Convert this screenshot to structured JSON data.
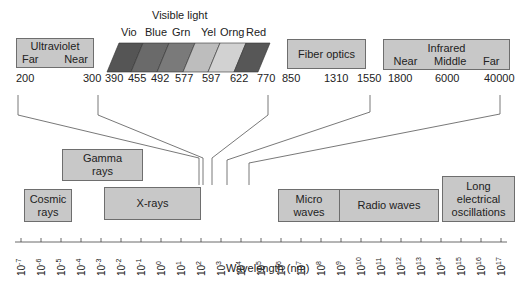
{
  "visible_light": {
    "title": "Visible light",
    "bands": [
      {
        "name": "Vio",
        "color": "#555555"
      },
      {
        "name": "Blue",
        "color": "#6a6a6a"
      },
      {
        "name": "Grn",
        "color": "#7a7a7a"
      },
      {
        "name": "Yel",
        "color": "#bdbdbd"
      },
      {
        "name": "Orng",
        "color": "#d0d0d0"
      },
      {
        "name": "Red",
        "color": "#575757"
      }
    ],
    "boundaries": [
      "390",
      "455",
      "492",
      "577",
      "597",
      "622",
      "770"
    ]
  },
  "ultraviolet": {
    "title": "Ultraviolet",
    "sub": [
      "Far",
      "Near"
    ],
    "range": [
      "200",
      "300"
    ]
  },
  "fiber_optics": {
    "title": "Fiber optics",
    "range": [
      "850",
      "1310",
      "1550"
    ]
  },
  "infrared": {
    "title": "Infrared",
    "sub": [
      "Near",
      "Middle",
      "Far"
    ],
    "range": [
      "1800",
      "6000",
      "40000"
    ]
  },
  "regions": {
    "gamma": "Gamma rays",
    "gamma_l1": "Gamma",
    "gamma_l2": "rays",
    "cosmic_l1": "Cosmic",
    "cosmic_l2": "rays",
    "xrays": "X-rays",
    "micro_l1": "Micro",
    "micro_l2": "waves",
    "radio": "Radio waves",
    "long_l1": "Long",
    "long_l2": "electrical",
    "long_l3": "oscillations"
  },
  "axis": {
    "label": "Wavelength (nm)",
    "exponents": [
      "-7",
      "-6",
      "-5",
      "-4",
      "-3",
      "-2",
      "-1",
      "0",
      "1",
      "2",
      "3",
      "4",
      "5",
      "6",
      "7",
      "8",
      "9",
      "10",
      "11",
      "12",
      "13",
      "14",
      "15",
      "16",
      "17"
    ]
  },
  "chart_data": {
    "type": "diagram",
    "xlabel": "Wavelength (nm)",
    "x_scale": "log10",
    "x_range": [
      -7,
      17
    ],
    "regions": [
      {
        "name": "Cosmic rays",
        "range_exp": [
          -7,
          -5
        ]
      },
      {
        "name": "Gamma rays",
        "range_exp": [
          -5,
          -1
        ]
      },
      {
        "name": "X-rays",
        "range_exp": [
          -3,
          2
        ]
      },
      {
        "name": "Micro waves",
        "range_exp": [
          6,
          9
        ]
      },
      {
        "name": "Radio waves",
        "range_exp": [
          9,
          14
        ]
      },
      {
        "name": "Long electrical oscillations",
        "range_exp": [
          14,
          17
        ]
      }
    ],
    "detail_ranges_nm": {
      "Ultraviolet": {
        "Far": [
          200,
          300
        ],
        "Near": [
          300,
          390
        ]
      },
      "Visible light": {
        "Vio": [
          390,
          455
        ],
        "Blue": [
          455,
          492
        ],
        "Grn": [
          492,
          577
        ],
        "Yel": [
          577,
          597
        ],
        "Orng": [
          597,
          622
        ],
        "Red": [
          622,
          770
        ]
      },
      "Fiber optics": [
        850,
        1310,
        1550
      ],
      "Infrared": {
        "Near": [
          1800,
          6000
        ],
        "Middle": [
          6000,
          40000
        ],
        "Far": [
          40000
        ]
      }
    }
  }
}
